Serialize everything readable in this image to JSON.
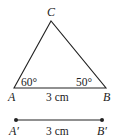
{
  "triangle": {
    "vertices": {
      "A": {
        "label": "A",
        "x": 14,
        "y": 88
      },
      "B": {
        "label": "B",
        "x": 106,
        "y": 88
      },
      "C": {
        "label": "C",
        "x": 51,
        "y": 21
      }
    },
    "angle_A": "60°",
    "angle_B": "50°",
    "side_AB": "3 cm"
  },
  "segment": {
    "start_label": "A′",
    "end_label": "B′",
    "length": "3 cm"
  },
  "colors": {
    "stroke": "#222222",
    "background": "#ffffff"
  }
}
